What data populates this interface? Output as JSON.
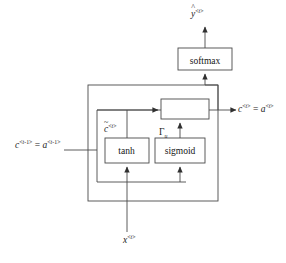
{
  "figure": {
    "type": "gru-cell-diagram",
    "stroke_color": "#3a3a3a",
    "text_color": "#1b1b1b",
    "background": "#ffffff"
  },
  "boxes": {
    "softmax": {
      "label": "softmax",
      "x": 178,
      "y": 48,
      "w": 54,
      "h": 22
    },
    "tanh": {
      "label": "tanh",
      "x": 105,
      "y": 138,
      "w": 44,
      "h": 25
    },
    "sigmoid": {
      "label": "sigmoid",
      "x": 155,
      "y": 138,
      "w": 50,
      "h": 25
    },
    "combiner": {
      "label": "",
      "x": 161,
      "y": 99,
      "w": 48,
      "h": 20
    },
    "cell_outer": {
      "label": "",
      "x": 88,
      "y": 85,
      "w": 130,
      "h": 116
    },
    "cell_inner": {
      "label": "",
      "x": 97,
      "y": 104,
      "w": 112,
      "h": 78
    }
  },
  "labels": {
    "y_hat": {
      "base": "y",
      "accent": "^",
      "sup": "<t>",
      "text": "ŷ<t>"
    },
    "c_prev": {
      "text": "c<t-1> = a<t-1>",
      "c_base": "c",
      "c_sup": "<t-1>",
      "eq": " = ",
      "a_base": "a",
      "a_sup": "<t-1>"
    },
    "c_out": {
      "text": "c<t> = a<t>",
      "c_base": "c",
      "c_sup": "<t>",
      "eq": " = ",
      "a_base": "a",
      "a_sup": "<t>"
    },
    "c_tilde": {
      "base": "c",
      "accent": "~",
      "sup": "<t>",
      "text": "c̃<t>"
    },
    "gamma_u": {
      "base": "Γ",
      "sub": "u",
      "text": "Γu"
    },
    "x_t": {
      "base": "x",
      "sup": "<t>",
      "text": "x<t>"
    }
  },
  "arrows": [
    {
      "name": "x-input-to-tanh",
      "from": "x<t>",
      "to": "tanh"
    },
    {
      "name": "x-input-to-sigmoid",
      "from": "x<t>",
      "to": "sigmoid"
    },
    {
      "name": "cprev-into-cell",
      "from": "c<t-1> = a<t-1>",
      "to": "cell"
    },
    {
      "name": "tanh-to-combiner",
      "from": "tanh",
      "to": "combiner"
    },
    {
      "name": "sigmoid-to-combiner",
      "from": "sigmoid",
      "to": "combiner"
    },
    {
      "name": "combiner-to-output",
      "from": "combiner",
      "to": "c<t> = a<t>"
    },
    {
      "name": "combiner-to-softmax",
      "from": "combiner",
      "to": "softmax"
    },
    {
      "name": "softmax-to-yhat",
      "from": "softmax",
      "to": "ŷ<t>"
    }
  ]
}
